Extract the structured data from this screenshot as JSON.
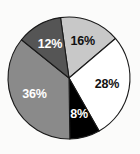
{
  "chart_data": {
    "type": "pie",
    "title": "",
    "xlabel": "",
    "ylabel": "",
    "legend": "none",
    "grid": false,
    "start_angle_deg": -8,
    "direction": "clockwise",
    "labels_format": "percent",
    "categories": [
      "16%",
      "28%",
      "8%",
      "36%",
      "12%"
    ],
    "values": [
      16,
      28,
      8,
      36,
      12
    ],
    "slices": [
      {
        "label": "16%",
        "value": 16,
        "color": "#c8c8c8",
        "text_color": "#111111"
      },
      {
        "label": "28%",
        "value": 28,
        "color": "#ffffff",
        "text_color": "#111111"
      },
      {
        "label": "8%",
        "value": 8,
        "color": "#000000",
        "text_color": "#ffffff"
      },
      {
        "label": "36%",
        "value": 36,
        "color": "#8a8a8a",
        "text_color": "#ffffff"
      },
      {
        "label": "12%",
        "value": 12,
        "color": "#555555",
        "text_color": "#ffffff"
      }
    ],
    "outline_color": "#1a1a1a",
    "background_color": "#fbfbfa"
  },
  "geometry": {
    "center_x": 69,
    "center_y": 78,
    "radius": 61,
    "label_radius_ratio": 0.63
  }
}
